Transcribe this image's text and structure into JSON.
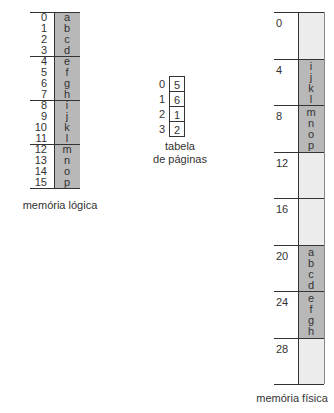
{
  "logical_memory": {
    "label": "memória lógica",
    "addresses": [
      "0",
      "1",
      "2",
      "3",
      "4",
      "5",
      "6",
      "7",
      "8",
      "9",
      "10",
      "11",
      "12",
      "13",
      "14",
      "15"
    ],
    "contents": [
      "a",
      "b",
      "c",
      "d",
      "e",
      "f",
      "g",
      "h",
      "i",
      "j",
      "k",
      "l",
      "m",
      "n",
      "o",
      "p"
    ]
  },
  "page_table": {
    "label_line1": "tabela",
    "label_line2": "de páginas",
    "indices": [
      "0",
      "1",
      "2",
      "3"
    ],
    "frames": [
      "5",
      "6",
      "1",
      "2"
    ]
  },
  "physical_memory": {
    "label": "memória física",
    "frame_addresses": [
      "0",
      "4",
      "8",
      "12",
      "16",
      "20",
      "24",
      "28"
    ],
    "frames": [
      {
        "used": false,
        "contents": []
      },
      {
        "used": true,
        "contents": [
          "i",
          "j",
          "k",
          "l"
        ]
      },
      {
        "used": true,
        "contents": [
          "m",
          "n",
          "o",
          "p"
        ]
      },
      {
        "used": false,
        "contents": []
      },
      {
        "used": false,
        "contents": []
      },
      {
        "used": true,
        "contents": [
          "a",
          "b",
          "c",
          "d"
        ]
      },
      {
        "used": true,
        "contents": [
          "e",
          "f",
          "g",
          "h"
        ]
      },
      {
        "used": false,
        "contents": []
      }
    ]
  },
  "colors": {
    "used_frame": "#b8b8b8",
    "free_frame": "#ececec",
    "line": "#333333"
  }
}
